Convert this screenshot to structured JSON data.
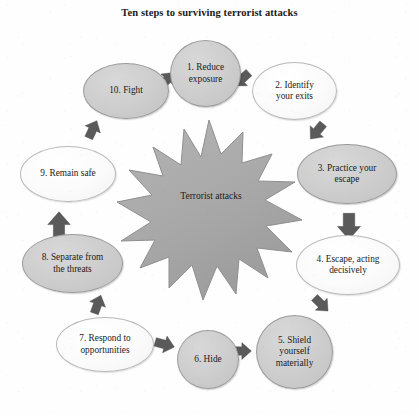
{
  "title": "Ten steps to surviving terrorist attacks",
  "center": {
    "label_line1": "Terrorist",
    "label_line2": "attacks",
    "shape": "explosion-star",
    "fill": "#a8a8a8",
    "stroke": "#8a8a8a"
  },
  "colors": {
    "page_background": "#fefefe",
    "node_grey_fill": "#cfcfcf",
    "node_white_fill": "#fbfbfb",
    "node_border": "#9a9a9a",
    "arrow_fill": "#5c5c5c",
    "text": "#1b1b1b"
  },
  "steps": [
    {
      "n": 1,
      "label": "1. Reduce exposure",
      "lines": [
        "1. Reduce",
        "exposure"
      ],
      "shape": "circle",
      "fill": "grey"
    },
    {
      "n": 2,
      "label": "2. Identify your exits",
      "lines": [
        "2. Identify",
        "your exits"
      ],
      "shape": "ellipse",
      "fill": "white"
    },
    {
      "n": 3,
      "label": "3. Practice your escape",
      "lines": [
        "3. Practice your",
        "escape"
      ],
      "shape": "ellipse",
      "fill": "grey"
    },
    {
      "n": 4,
      "label": "4. Escape, acting decisively",
      "lines": [
        "4. Escape, acting",
        "decisively"
      ],
      "shape": "ellipse",
      "fill": "white"
    },
    {
      "n": 5,
      "label": "5. Shield yourself materially",
      "lines": [
        "5. Shield",
        "yourself",
        "materially"
      ],
      "shape": "circle",
      "fill": "grey"
    },
    {
      "n": 6,
      "label": "6. Hide",
      "lines": [
        "6. Hide"
      ],
      "shape": "circle",
      "fill": "grey"
    },
    {
      "n": 7,
      "label": "7. Respond to opportunities",
      "lines": [
        "7. Respond to",
        "opportunities"
      ],
      "shape": "ellipse",
      "fill": "white"
    },
    {
      "n": 8,
      "label": "8. Separate from the threats",
      "lines": [
        "8. Separate from",
        "the threats"
      ],
      "shape": "ellipse",
      "fill": "grey"
    },
    {
      "n": 9,
      "label": "9. Remain safe",
      "lines": [
        "9. Remain safe"
      ],
      "shape": "ellipse",
      "fill": "white"
    },
    {
      "n": 10,
      "label": "10. Fight",
      "lines": [
        "10. Fight"
      ],
      "shape": "ellipse",
      "fill": "grey"
    }
  ],
  "arrows": [
    {
      "from": 1,
      "to": 2,
      "direction": "down-right"
    },
    {
      "from": 2,
      "to": 3,
      "direction": "down-right"
    },
    {
      "from": 3,
      "to": 4,
      "direction": "down"
    },
    {
      "from": 4,
      "to": 5,
      "direction": "down-left"
    },
    {
      "from": 5,
      "to": 6,
      "direction": "left"
    },
    {
      "from": 6,
      "to": 7,
      "direction": "left"
    },
    {
      "from": 7,
      "to": 8,
      "direction": "up-left"
    },
    {
      "from": 8,
      "to": 9,
      "direction": "up"
    },
    {
      "from": 9,
      "to": 10,
      "direction": "up-right"
    },
    {
      "from": 10,
      "to": 1,
      "direction": "up-right"
    }
  ]
}
